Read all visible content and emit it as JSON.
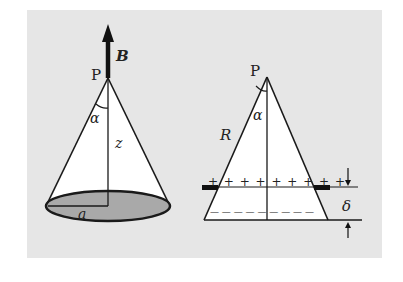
{
  "figure": {
    "background_color": "#e6e6e6",
    "left_diagram": {
      "apex_label": "P",
      "field_label": "B",
      "angle_label": "α",
      "height_label": "z",
      "radius_label": "a",
      "base_fill": "#a9a9a9"
    },
    "right_diagram": {
      "apex_label": "P",
      "angle_label": "α",
      "slant_label": "R",
      "thickness_label": "δ",
      "top_charges": "+ + + + + + + + +",
      "bottom_charges": "— — — — — — — — —"
    }
  }
}
